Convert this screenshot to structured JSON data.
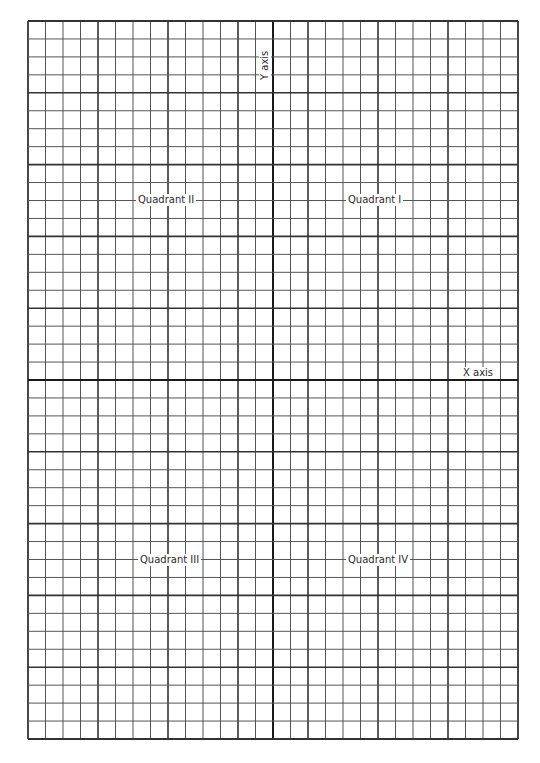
{
  "diagram": {
    "type": "coordinate-plane-grid",
    "columns": 28,
    "rows": 40,
    "major_every": 4,
    "origin_col": 14,
    "origin_row": 20,
    "colors": {
      "line": "#555555",
      "major": "#333333",
      "axis": "#1a1a1a"
    }
  },
  "labels": {
    "x_axis": "X axis",
    "y_axis": "Y axis",
    "q1": "Quadrant I",
    "q2": "Quadrant II",
    "q3": "Quadrant III",
    "q4": "Quadrant IV"
  }
}
